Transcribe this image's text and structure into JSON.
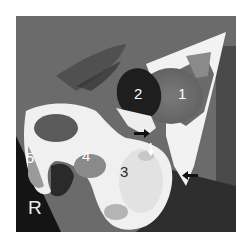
{
  "image": {
    "kind": "axial CT scan",
    "labels": [
      {
        "id": "1",
        "text": "1"
      },
      {
        "id": "2",
        "text": "2"
      },
      {
        "id": "3",
        "text": "3"
      },
      {
        "id": "4",
        "text": "4"
      },
      {
        "id": "5",
        "text": "5"
      }
    ],
    "side_marker": "R",
    "arrows": [
      {
        "id": "arrow-left-upper",
        "color": "#111111",
        "direction": "right"
      },
      {
        "id": "arrow-down",
        "color": "#ffffff",
        "direction": "down"
      },
      {
        "id": "arrow-left-lower",
        "color": "#111111",
        "direction": "left"
      }
    ],
    "colors": {
      "background": "#ffffff",
      "soft_tissue": "#6a6a6a",
      "bone": "#f4f4f4",
      "dark_fluid": "#1e1e1e",
      "fat_dark": "#2c2c2c"
    }
  }
}
